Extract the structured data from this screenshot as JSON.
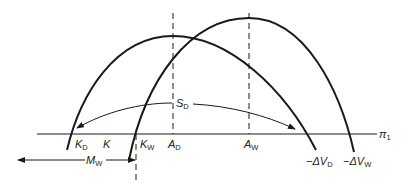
{
  "diagram": {
    "axis_label": "π",
    "axis_label_sub": "1",
    "curves": [
      {
        "name": "-ΔV_D",
        "label_main": "−ΔV",
        "label_sub": "D",
        "peak_label": "A",
        "peak_sub": "D",
        "left_root_label": "K",
        "left_root_sub": "D"
      },
      {
        "name": "-ΔV_W",
        "label_main": "−ΔV",
        "label_sub": "W",
        "peak_label": "A",
        "peak_sub": "W",
        "left_root_label": "K",
        "left_root_sub": "W"
      }
    ],
    "middle_label": "K",
    "sd_label": "S",
    "sd_sub": "D",
    "mw_label": "M",
    "mw_sub": "W",
    "colors": {
      "line": "#1a1a1a",
      "text": "#222222",
      "background": "#ffffff"
    }
  }
}
